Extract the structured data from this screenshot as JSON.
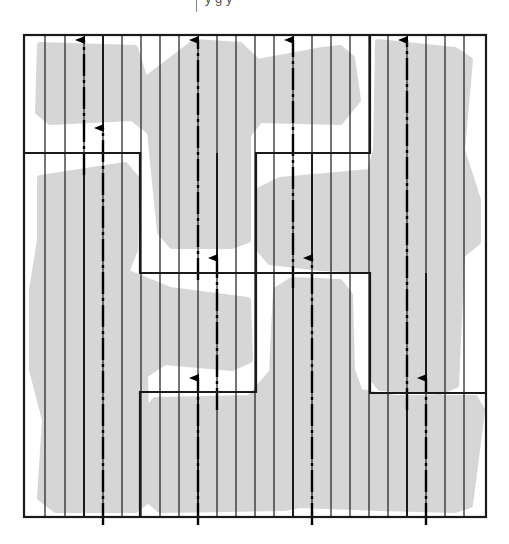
{
  "figure": {
    "caption_fragment": "y    g    y",
    "width": 509,
    "height": 544,
    "colors": {
      "tile_fill": "#d6d6d6",
      "line": "#1a1a1a",
      "background": "#ffffff",
      "axis": "#000000"
    },
    "outer_box": {
      "x1": 24,
      "y1": 35,
      "x2": 486,
      "y2": 517
    },
    "strip_lines_x": [
      45,
      65,
      84,
      103,
      122,
      141,
      160,
      179,
      198,
      217,
      236,
      255,
      274,
      293,
      312,
      331,
      350,
      369,
      388,
      407,
      426,
      445,
      464
    ],
    "region_boundaries": [
      [
        [
          24,
          153
        ],
        [
          140,
          153
        ],
        [
          140,
          273
        ],
        [
          256,
          273
        ],
        [
          256,
          153
        ],
        [
          370,
          153
        ],
        [
          370,
          35
        ]
      ],
      [
        [
          140,
          517
        ],
        [
          140,
          392
        ],
        [
          256,
          392
        ],
        [
          256,
          273
        ],
        [
          370,
          273
        ],
        [
          370,
          393
        ],
        [
          486,
          393
        ]
      ]
    ],
    "tiles": [
      {
        "name": "tile-top-left",
        "points": [
          [
            40,
            45
          ],
          [
            135,
            48
          ],
          [
            145,
            80
          ],
          [
            195,
            42
          ],
          [
            240,
            45
          ],
          [
            258,
            62
          ],
          [
            322,
            50
          ],
          [
            340,
            48
          ],
          [
            352,
            58
          ],
          [
            358,
            100
          ],
          [
            340,
            122
          ],
          [
            260,
            120
          ],
          [
            248,
            135
          ],
          [
            248,
            240
          ],
          [
            232,
            246
          ],
          [
            172,
            246
          ],
          [
            160,
            232
          ],
          [
            150,
            132
          ],
          [
            132,
            118
          ],
          [
            50,
            122
          ],
          [
            38,
            112
          ]
        ]
      },
      {
        "name": "tile-top-right",
        "points": [
          [
            378,
            42
          ],
          [
            455,
            50
          ],
          [
            470,
            60
          ],
          [
            462,
            150
          ],
          [
            478,
            200
          ],
          [
            478,
            242
          ],
          [
            462,
            255
          ],
          [
            456,
            385
          ],
          [
            440,
            392
          ],
          [
            380,
            388
          ],
          [
            372,
            378
          ],
          [
            374,
            270
          ],
          [
            320,
            268
          ],
          [
            270,
            262
          ],
          [
            258,
            248
          ],
          [
            260,
            190
          ],
          [
            280,
            180
          ],
          [
            370,
            172
          ],
          [
            376,
            150
          ]
        ]
      },
      {
        "name": "tile-left",
        "points": [
          [
            40,
            178
          ],
          [
            125,
            165
          ],
          [
            136,
            178
          ],
          [
            135,
            250
          ],
          [
            126,
            272
          ],
          [
            170,
            290
          ],
          [
            248,
            300
          ],
          [
            250,
            360
          ],
          [
            232,
            368
          ],
          [
            165,
            362
          ],
          [
            145,
            375
          ],
          [
            148,
            500
          ],
          [
            135,
            510
          ],
          [
            56,
            510
          ],
          [
            40,
            498
          ],
          [
            45,
            420
          ],
          [
            32,
            370
          ],
          [
            32,
            290
          ],
          [
            40,
            240
          ]
        ]
      },
      {
        "name": "tile-bottom-center",
        "points": [
          [
            155,
            400
          ],
          [
            250,
            398
          ],
          [
            260,
            386
          ],
          [
            272,
            372
          ],
          [
            276,
            290
          ],
          [
            292,
            280
          ],
          [
            340,
            282
          ],
          [
            350,
            295
          ],
          [
            352,
            370
          ],
          [
            360,
            392
          ],
          [
            395,
            398
          ],
          [
            475,
            398
          ],
          [
            482,
            410
          ],
          [
            470,
            505
          ],
          [
            455,
            510
          ],
          [
            380,
            508
          ],
          [
            300,
            505
          ],
          [
            285,
            508
          ],
          [
            160,
            510
          ],
          [
            148,
            500
          ],
          [
            146,
            412
          ]
        ]
      }
    ],
    "axes": [
      {
        "name": "axis-1",
        "x": 84,
        "y_start": 175,
        "y_end": 40,
        "style": "dash-dot"
      },
      {
        "name": "axis-2",
        "x": 103,
        "y_start": 525,
        "y_end": 128,
        "style": "dash-dot"
      },
      {
        "name": "axis-3",
        "x": 198,
        "y_start": 280,
        "y_end": 40,
        "style": "dash-dot"
      },
      {
        "name": "axis-4",
        "x": 198,
        "y_start": 525,
        "y_end": 378,
        "style": "dash-dot"
      },
      {
        "name": "axis-5",
        "x": 217,
        "y_start": 410,
        "y_end": 258,
        "style": "dash-dot"
      },
      {
        "name": "axis-6",
        "x": 293,
        "y_start": 288,
        "y_end": 40,
        "style": "dash-dot"
      },
      {
        "name": "axis-7",
        "x": 312,
        "y_start": 525,
        "y_end": 258,
        "style": "dash-dot"
      },
      {
        "name": "axis-8",
        "x": 407,
        "y_start": 410,
        "y_end": 40,
        "style": "dash-dot"
      },
      {
        "name": "axis-9",
        "x": 426,
        "y_start": 525,
        "y_end": 378,
        "style": "dash-dot"
      },
      {
        "name": "axis-10",
        "x": 312,
        "y_start": 175,
        "y_end": 40,
        "style": "dash-dot",
        "hidden_overlap": true
      }
    ],
    "solid_segments": [
      {
        "x": 84,
        "y1": 175,
        "y2": 517
      },
      {
        "x": 103,
        "y1": 128,
        "y2": 35
      },
      {
        "x": 198,
        "y1": 392,
        "y2": 517
      },
      {
        "x": 217,
        "y1": 258,
        "y2": 153
      },
      {
        "x": 293,
        "y1": 288,
        "y2": 517
      },
      {
        "x": 312,
        "y1": 258,
        "y2": 153
      },
      {
        "x": 407,
        "y1": 410,
        "y2": 517
      },
      {
        "x": 426,
        "y1": 378,
        "y2": 273
      }
    ]
  }
}
